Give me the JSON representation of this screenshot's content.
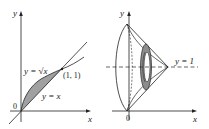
{
  "left_figure": {
    "axis_x_label": "x",
    "axis_y_label": "y",
    "origin_label": "0",
    "curve_sqrt_label": "y = √x",
    "curve_line_label": "y = x",
    "intersection_label": "(1, 1)",
    "shaded_color": "#9a9a9a"
  },
  "right_figure": {
    "axis_x_label": "x",
    "axis_y_label": "y",
    "origin_label": "0",
    "axis_of_rotation_label": "y = 1",
    "washer_color": "#8c8c8c"
  }
}
